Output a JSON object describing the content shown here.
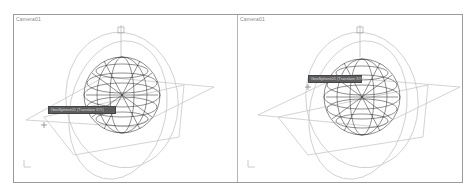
{
  "viewports": [
    {
      "label": "Camera01",
      "tooltip": "GeoSphere01 (Translate X/Y)"
    },
    {
      "label": "Camera01",
      "tooltip": "GeoSphere01 (Translate X/Y)"
    }
  ],
  "colors": {
    "frame": "#9a9a9a",
    "wire": "#222222",
    "gizmo": "#c8c8c8",
    "tooltip_bg": "#5e5e5e"
  }
}
